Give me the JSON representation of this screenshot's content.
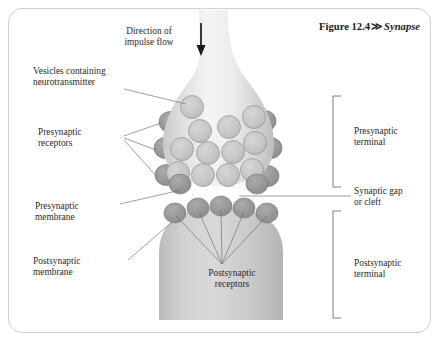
{
  "figure": {
    "number": "Figure 12.4",
    "separator": "≫",
    "name": "Synapse"
  },
  "labels": {
    "direction": "Direction of\nimpulse flow",
    "vesicles": "Vesicles containing\nneurotransmitter",
    "presynaptic_receptors": "Presynaptic\nreceptors",
    "presynaptic_membrane": "Presynaptic\nmembrane",
    "postsynaptic_membrane": "Postsynaptic\nmembrane",
    "presynaptic_terminal": "Presynaptic\nterminal",
    "synaptic_gap": "Synaptic gap\nor cleft",
    "postsynaptic_terminal": "Postsynaptic\nterminal",
    "postsynaptic_receptors": "Postsynaptic\nreceptors"
  },
  "colors": {
    "frame_border": "#cfcfcf",
    "background": "#ffffff",
    "terminal_fill_light": "#f2f2f2",
    "terminal_fill_mid": "#d9d9d9",
    "terminal_fill_dark": "#bdbdbd",
    "vesicle_fill": "#c9c9c9",
    "vesicle_stroke": "#8f8f8f",
    "receptor_fill": "#9a9a9a",
    "receptor_stroke": "#7d7d7d",
    "postsynaptic_fill": "#c6c6c6",
    "leader_line": "#6e6e6e",
    "arrow": "#1a1a1a",
    "text": "#2b2b2b"
  },
  "structure": {
    "vesicle_count": 13,
    "presynaptic_receptor_count": 6,
    "postsynaptic_receptor_count": 5,
    "brackets": [
      "presynaptic-terminal",
      "postsynaptic-terminal"
    ]
  }
}
